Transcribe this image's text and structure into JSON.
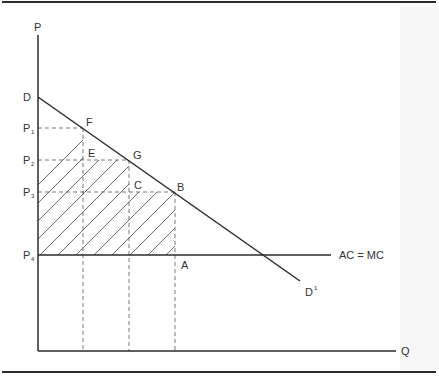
{
  "figure": {
    "axes": {
      "y_label": "P",
      "x_label": "Q"
    },
    "price_labels": [
      {
        "main": "D",
        "sub": ""
      },
      {
        "main": "P",
        "sub": "1"
      },
      {
        "main": "P",
        "sub": "2"
      },
      {
        "main": "P",
        "sub": "3"
      },
      {
        "main": "P",
        "sub": "4"
      }
    ],
    "point_labels": {
      "F": "F",
      "E": "E",
      "G": "G",
      "C": "C",
      "B": "B",
      "A": "A"
    },
    "curves": {
      "demand_end": {
        "main": "D",
        "sup": "1"
      },
      "cost": "AC = MC"
    },
    "colors": {
      "line": "#2a2a2a",
      "dash": "#555555",
      "hatch": "#444444",
      "text": "#333333",
      "rule": "#2a2a2a"
    }
  }
}
